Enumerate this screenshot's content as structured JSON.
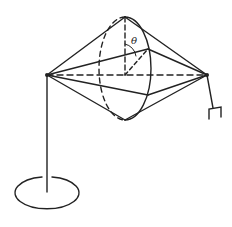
{
  "diagram": {
    "type": "physics-apparatus",
    "labels": {
      "angle": "θ"
    },
    "colors": {
      "stroke": "#222222",
      "background": "#ffffff"
    }
  }
}
